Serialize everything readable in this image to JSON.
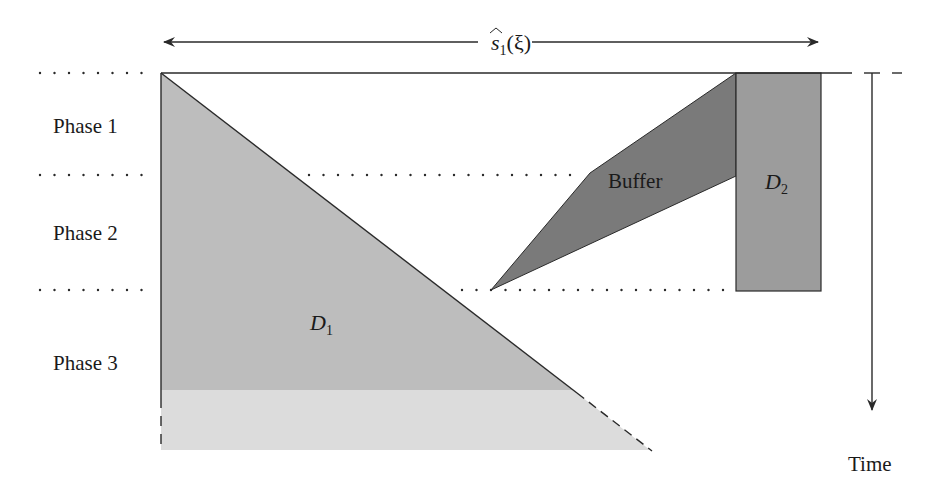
{
  "diagram": {
    "top_label": {
      "base": "s",
      "subscript": "1",
      "arg": "(ξ)"
    },
    "phases": [
      {
        "label": "Phase 1"
      },
      {
        "label": "Phase 2"
      },
      {
        "label": "Phase 3"
      }
    ],
    "regions": {
      "d1": {
        "letter": "D",
        "subscript": "1"
      },
      "d2": {
        "letter": "D",
        "subscript": "2"
      },
      "buffer": {
        "label": "Buffer"
      }
    },
    "time_axis": {
      "label": "Time"
    },
    "colors": {
      "d1_fill": "#bdbdbd",
      "d1_tail_fill": "#dcdcdc",
      "buffer_fill": "#7a7a7a",
      "d2_fill": "#9c9c9c",
      "line": "#2a2a2a"
    }
  }
}
